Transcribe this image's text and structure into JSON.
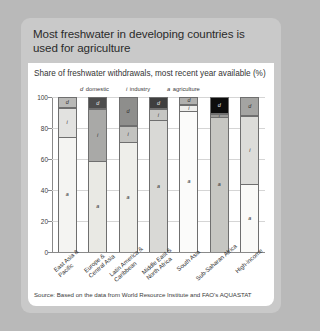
{
  "card": {
    "title": "Most freshwater in developing countries is used for agriculture",
    "subtitle": "Share of freshwater withdrawals, most recent year available (%)",
    "source": "Source: Based on the data from World Resource Institute and FAO's  AQUASTAT"
  },
  "legend": [
    {
      "key": "d",
      "label": "domestic"
    },
    {
      "key": "i",
      "label": "industry"
    },
    {
      "key": "a",
      "label": "agriculture"
    }
  ],
  "colors": {
    "agriculture": "#f2f2f0",
    "industry": "#c9c9c9",
    "domestic": "#9d9d9d",
    "panel": "#ffffff",
    "card": "#c9c9c9",
    "page": "#b9b9b9",
    "axis": "#8a8a8a",
    "grid": "#d5d5d5"
  },
  "chart_data": {
    "type": "bar",
    "title": "Most freshwater in developing countries is used for agriculture",
    "subtitle": "Share of freshwater withdrawals, most recent year available (%)",
    "stacked": true,
    "xlabel": "",
    "ylabel": "",
    "ylim": [
      0,
      100
    ],
    "yticks": [
      0,
      20,
      40,
      60,
      80,
      100
    ],
    "ytick_labels": [
      "0",
      "20",
      "40",
      "60",
      "80",
      "100"
    ],
    "grid": true,
    "legend_position": "top",
    "categories": [
      "East Asia & Pacific",
      "Europe & Central Asia",
      "Latin America & Caribbean",
      "Middle East & North Africa",
      "South Asia",
      "Sub-Saharan Africa",
      "High-income"
    ],
    "series": [
      {
        "name": "agriculture",
        "key": "a",
        "color": "#f2f2f0",
        "values": [
          74,
          59,
          71,
          85,
          91,
          87,
          44
        ]
      },
      {
        "name": "industry",
        "key": "i",
        "color": "#c9c9c9",
        "values": [
          19,
          33,
          10,
          7,
          4,
          2,
          44
        ]
      },
      {
        "name": "domestic",
        "key": "d",
        "color": "#9d9d9d",
        "values": [
          7,
          8,
          19,
          8,
          5,
          11,
          12
        ]
      }
    ],
    "bars": [
      {
        "category": "East Asia & Pacific",
        "segments": [
          {
            "key": "a",
            "name": "agriculture",
            "value": 74,
            "color": "#f4f4f2",
            "label": "a"
          },
          {
            "key": "i",
            "name": "industry",
            "value": 19,
            "color": "#e2e2e0",
            "label": "i"
          },
          {
            "key": "d",
            "name": "domestic",
            "value": 7,
            "color": "#b9b9b7",
            "label": "d"
          }
        ]
      },
      {
        "category": "Europe & Central Asia",
        "segments": [
          {
            "key": "a",
            "name": "agriculture",
            "value": 59,
            "color": "#e9e9e4",
            "label": "a"
          },
          {
            "key": "i",
            "name": "industry",
            "value": 33,
            "color": "#a9a9a7",
            "label": "i"
          },
          {
            "key": "d",
            "name": "domestic",
            "value": 8,
            "color": "#4d4d4d",
            "label": "d"
          }
        ]
      },
      {
        "category": "Latin America & Caribbean",
        "segments": [
          {
            "key": "a",
            "name": "agriculture",
            "value": 71,
            "color": "#eeeeea",
            "label": "a"
          },
          {
            "key": "i",
            "name": "industry",
            "value": 10,
            "color": "#c2c2bf",
            "label": "i"
          },
          {
            "key": "d",
            "name": "domestic",
            "value": 19,
            "color": "#8e8e8c",
            "label": "d"
          }
        ]
      },
      {
        "category": "Middle East & North Africa",
        "segments": [
          {
            "key": "a",
            "name": "agriculture",
            "value": 85,
            "color": "#d9d9d6",
            "label": "a"
          },
          {
            "key": "i",
            "name": "industry",
            "value": 7,
            "color": "#c6c6c3",
            "label": "i"
          },
          {
            "key": "d",
            "name": "domestic",
            "value": 8,
            "color": "#3f3f3f",
            "label": "d"
          }
        ]
      },
      {
        "category": "South Asia",
        "segments": [
          {
            "key": "a",
            "name": "agriculture",
            "value": 91,
            "color": "#fbfbfa",
            "label": "a"
          },
          {
            "key": "i",
            "name": "industry",
            "value": 4,
            "color": "#eeeeec",
            "label": "i"
          },
          {
            "key": "d",
            "name": "domestic",
            "value": 5,
            "color": "#b0b0ae",
            "label": "d"
          }
        ]
      },
      {
        "category": "Sub-Saharan Africa",
        "segments": [
          {
            "key": "a",
            "name": "agriculture",
            "value": 87,
            "color": "#c6c6c2",
            "label": "a"
          },
          {
            "key": "i",
            "name": "industry",
            "value": 2,
            "color": "#9a9a98",
            "label": "i"
          },
          {
            "key": "d",
            "name": "domestic",
            "value": 11,
            "color": "#0d0d0d",
            "label": "d"
          }
        ]
      },
      {
        "category": "High-income",
        "segments": [
          {
            "key": "a",
            "name": "agriculture",
            "value": 44,
            "color": "#fafaf8",
            "label": "a"
          },
          {
            "key": "i",
            "name": "industry",
            "value": 44,
            "color": "#dcdcd9",
            "label": "i"
          },
          {
            "key": "d",
            "name": "domestic",
            "value": 12,
            "color": "#a4a4a2",
            "label": "d"
          }
        ]
      }
    ]
  }
}
